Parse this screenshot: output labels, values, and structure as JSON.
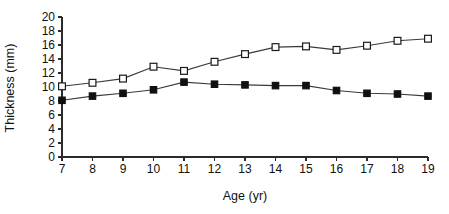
{
  "chart_data": {
    "type": "line",
    "title": "",
    "xlabel": "Age (yr)",
    "ylabel": "Thickness (mm)",
    "x": [
      7,
      8,
      9,
      10,
      11,
      12,
      13,
      14,
      15,
      16,
      17,
      18,
      19
    ],
    "xtick_labels": [
      "7",
      "8",
      "9",
      "10",
      "11",
      "12",
      "13",
      "14",
      "15",
      "16",
      "17",
      "18",
      "19"
    ],
    "ytick_labels": [
      "0",
      "2",
      "4",
      "6",
      "8",
      "10",
      "12",
      "14",
      "16",
      "18",
      "20"
    ],
    "yticks": [
      0,
      2,
      4,
      6,
      8,
      10,
      12,
      14,
      16,
      18,
      20
    ],
    "xlim": [
      7,
      19
    ],
    "ylim": [
      0,
      20
    ],
    "grid": false,
    "legend": "none",
    "series": [
      {
        "name": "open-square-series",
        "marker": "open-square",
        "color": "#1b1b1b",
        "values": [
          10.1,
          10.6,
          11.2,
          12.9,
          12.3,
          13.6,
          14.7,
          15.7,
          15.8,
          15.3,
          15.9,
          16.6,
          16.9
        ]
      },
      {
        "name": "filled-square-series",
        "marker": "filled-square",
        "color": "#101010",
        "values": [
          8.1,
          8.7,
          9.1,
          9.6,
          10.7,
          10.4,
          10.3,
          10.2,
          10.2,
          9.5,
          9.1,
          9.0,
          8.7
        ]
      }
    ]
  }
}
